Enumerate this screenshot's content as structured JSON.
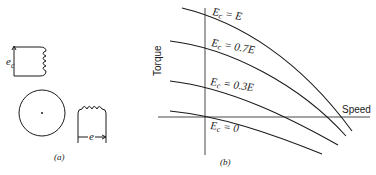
{
  "panel_a": {
    "caption": "(a)",
    "control_winding_label": "e",
    "control_winding_subscript": "c",
    "main_winding_label": "e"
  },
  "panel_b": {
    "caption": "(b)",
    "y_axis_label": "Torque",
    "x_axis_label": "Speed",
    "curves": [
      {
        "label_main": "E",
        "label_sub": "c",
        "label_rest": " = E"
      },
      {
        "label_main": "E",
        "label_sub": "c",
        "label_rest": " = 0.7E"
      },
      {
        "label_main": "E",
        "label_sub": "c",
        "label_rest": " = 0.3E"
      },
      {
        "label_main": "E",
        "label_sub": "c",
        "label_rest": " = 0"
      }
    ]
  },
  "colors": {
    "line": "#1a1a1a",
    "background": "#ffffff"
  }
}
